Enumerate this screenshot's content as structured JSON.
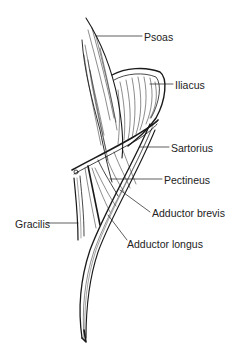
{
  "diagram": {
    "line_color": "#1a1a1a",
    "background": "#ffffff",
    "labels": [
      {
        "id": "psoas",
        "text": "Psoas",
        "x": 144,
        "y": 31
      },
      {
        "id": "iliacus",
        "text": "Iliacus",
        "x": 175,
        "y": 79
      },
      {
        "id": "sartorius",
        "text": "Sartorius",
        "x": 171,
        "y": 142
      },
      {
        "id": "pectineus",
        "text": "Pectineus",
        "x": 164,
        "y": 174
      },
      {
        "id": "adductor-brevis",
        "text": "Adductor brevis",
        "x": 152,
        "y": 207
      },
      {
        "id": "adductor-longus",
        "text": "Adductor longus",
        "x": 127,
        "y": 238
      },
      {
        "id": "gracilis",
        "text": "Gracilis",
        "x": 15,
        "y": 218
      }
    ]
  }
}
